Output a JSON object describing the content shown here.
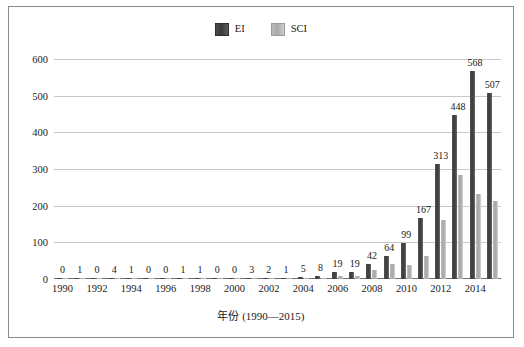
{
  "chart_data": {
    "type": "bar",
    "title": "",
    "xlabel": "年份 (1990—2015)",
    "ylabel": "",
    "ylim": [
      0,
      600
    ],
    "yticks": [
      0,
      100,
      200,
      300,
      400,
      500,
      600
    ],
    "grid": true,
    "legend_position": "top-center",
    "categories": [
      "1990",
      "1991",
      "1992",
      "1993",
      "1994",
      "1995",
      "1996",
      "1997",
      "1998",
      "1999",
      "2000",
      "2001",
      "2002",
      "2003",
      "2004",
      "2005",
      "2006",
      "2007",
      "2008",
      "2009",
      "2010",
      "2011",
      "2012",
      "2013",
      "2014",
      "2015"
    ],
    "xtick_labels": [
      "1990",
      "1992",
      "1994",
      "1996",
      "1998",
      "2000",
      "2002",
      "2004",
      "2006",
      "2008",
      "2010",
      "2012",
      "2014"
    ],
    "series": [
      {
        "name": "EI",
        "color": "#3f3f3f",
        "values": [
          0,
          1,
          0,
          4,
          1,
          0,
          0,
          1,
          1,
          0,
          0,
          3,
          2,
          1,
          5,
          8,
          19,
          19,
          42,
          64,
          99,
          167,
          313,
          448,
          568,
          507
        ],
        "labels": [
          "0",
          "1",
          "0",
          "4",
          "1",
          "0",
          "0",
          "1",
          "1",
          "0",
          "0",
          "3",
          "2",
          "1",
          "5",
          "8",
          "19",
          "19",
          "42",
          "64",
          "99",
          "167",
          "313",
          "448",
          "568",
          "507"
        ]
      },
      {
        "name": "SCI",
        "color": "#b0b0b0",
        "values": [
          0,
          0,
          0,
          1,
          0,
          0,
          0,
          0,
          0,
          0,
          0,
          1,
          1,
          0,
          2,
          3,
          8,
          8,
          24,
          40,
          37,
          62,
          160,
          283,
          232,
          213
        ],
        "labels": []
      }
    ]
  },
  "legend": {
    "items": [
      {
        "label": "EI",
        "swatch": "ei-swatch"
      },
      {
        "label": "SCI",
        "swatch": "sci-swatch"
      }
    ]
  }
}
